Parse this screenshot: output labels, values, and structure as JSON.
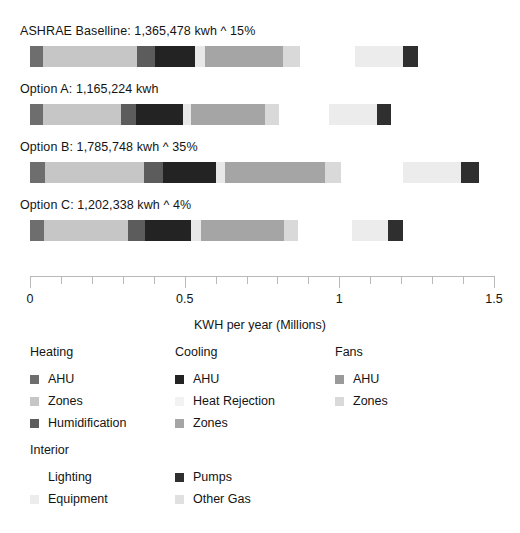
{
  "chart_data": {
    "type": "bar",
    "orientation": "horizontal",
    "stacked": true,
    "title": "",
    "xlabel": "KWH per year (Millions)",
    "ylabel": "",
    "xlim": [
      0,
      1.5
    ],
    "xticks": [
      0,
      0.1,
      0.2,
      0.3,
      0.4,
      0.5,
      0.6,
      0.7,
      0.8,
      0.9,
      1,
      1.1,
      1.2,
      1.3,
      1.4,
      1.5
    ],
    "xtick_labels": [
      "0",
      "0.5",
      "1",
      "1.5"
    ],
    "xtick_label_values": [
      0,
      0.5,
      1,
      1.5
    ],
    "grid": false,
    "legend_position": "below",
    "units": "Millions of KWH per year",
    "categories": [
      "ASHRAE Baselline: 1,365,478 kwh ^ 15%",
      "Option A: 1,165,224 kwh",
      "Option B: 1,785,748 kwh ^ 35%",
      "Option C: 1,202,338 kwh ^ 4%"
    ],
    "series": [
      {
        "name": "Heating AHU",
        "color": "#6e6e6e",
        "values": [
          0.042,
          0.042,
          0.046,
          0.044
        ]
      },
      {
        "name": "Heating Zones",
        "color": "#c6c6c6",
        "values": [
          0.302,
          0.25,
          0.33,
          0.27
        ]
      },
      {
        "name": "Heating Humidification",
        "color": "#5c5c5c",
        "values": [
          0.04,
          0.048,
          0.06,
          0.055
        ]
      },
      {
        "name": "Cooling AHU",
        "color": "#232323",
        "values": [
          0.13,
          0.15,
          0.165,
          0.15
        ]
      },
      {
        "name": "Cooling Heat Rejection",
        "color": "#e8e8e8",
        "values": [
          0.033,
          0.028,
          0.035,
          0.032
        ]
      },
      {
        "name": "Cooling Zones",
        "color": "#a5a5a5",
        "values": [
          0.255,
          0.24,
          0.32,
          0.263
        ]
      },
      {
        "name": "Fans AHU",
        "color": "#9a9a9a",
        "values": [
          0.0,
          0.0,
          0.0,
          0.0
        ]
      },
      {
        "name": "Fans Zones",
        "color": "#d9d9d9",
        "values": [
          0.055,
          0.0,
          0.0,
          0.0
        ]
      },
      {
        "name": "Interior Lighting",
        "color": "#ffffff",
        "values": [
          0.18,
          0.16,
          0.24,
          0.17
        ]
      },
      {
        "name": "Interior Equipment",
        "color": "#ececec",
        "values": [
          0.15,
          0.16,
          0.22,
          0.15
        ]
      },
      {
        "name": "Pumps",
        "color": "#2f2f2f",
        "values": [
          0.048,
          0.048,
          0.06,
          0.048
        ]
      },
      {
        "name": "Other Gas",
        "color": "#e0e0e0",
        "values": [
          0.0,
          0.0,
          0.0,
          0.0
        ]
      }
    ],
    "bars": [
      {
        "label": "ASHRAE Baselline: 1,365,478 kwh ^ 15%",
        "total_kwh": "1,365,478 kwh",
        "delta": "^ 15%",
        "segments": [
          {
            "name": "Heating AHU",
            "color": "#6e6e6e",
            "start": 0.0,
            "end": 0.042
          },
          {
            "name": "Heating Zones",
            "color": "#c6c6c6",
            "start": 0.042,
            "end": 0.345
          },
          {
            "name": "Heating Humidification",
            "color": "#5c5c5c",
            "start": 0.345,
            "end": 0.404
          },
          {
            "name": "Cooling AHU",
            "color": "#232323",
            "start": 0.404,
            "end": 0.533
          },
          {
            "name": "Cooling Heat Rejection",
            "color": "#e8e8e8",
            "start": 0.533,
            "end": 0.566
          },
          {
            "name": "Cooling Zones",
            "color": "#a5a5a5",
            "start": 0.566,
            "end": 0.818
          },
          {
            "name": "Fans Zones",
            "color": "#d9d9d9",
            "start": 0.818,
            "end": 0.873
          },
          {
            "name": "Interior Lighting",
            "color": "#ffffff",
            "start": 0.873,
            "end": 1.05
          },
          {
            "name": "Interior Equipment",
            "color": "#ececec",
            "start": 1.05,
            "end": 1.205
          },
          {
            "name": "Pumps",
            "color": "#2f2f2f",
            "start": 1.205,
            "end": 1.253
          }
        ]
      },
      {
        "label": "Option A: 1,165,224 kwh",
        "total_kwh": "1,165,224 kwh",
        "delta": "",
        "segments": [
          {
            "name": "Heating AHU",
            "color": "#6e6e6e",
            "start": 0.0,
            "end": 0.043
          },
          {
            "name": "Heating Zones",
            "color": "#c6c6c6",
            "start": 0.043,
            "end": 0.295
          },
          {
            "name": "Heating Humidification",
            "color": "#5c5c5c",
            "start": 0.295,
            "end": 0.343
          },
          {
            "name": "Cooling AHU",
            "color": "#232323",
            "start": 0.343,
            "end": 0.495
          },
          {
            "name": "Cooling Heat Rejection",
            "color": "#e8e8e8",
            "start": 0.495,
            "end": 0.522
          },
          {
            "name": "Cooling Zones",
            "color": "#a5a5a5",
            "start": 0.522,
            "end": 0.76
          },
          {
            "name": "Fans Zones",
            "color": "#d9d9d9",
            "start": 0.76,
            "end": 0.805
          },
          {
            "name": "Interior Lighting",
            "color": "#ffffff",
            "start": 0.805,
            "end": 0.968
          },
          {
            "name": "Interior Equipment",
            "color": "#ececec",
            "start": 0.968,
            "end": 1.122
          },
          {
            "name": "Pumps",
            "color": "#2f2f2f",
            "start": 1.122,
            "end": 1.168
          }
        ]
      },
      {
        "label": "Option B: 1,785,748 kwh ^ 35%",
        "total_kwh": "1,785,748 kwh",
        "delta": "^ 35%",
        "segments": [
          {
            "name": "Heating AHU",
            "color": "#6e6e6e",
            "start": 0.0,
            "end": 0.048
          },
          {
            "name": "Heating Zones",
            "color": "#c6c6c6",
            "start": 0.048,
            "end": 0.368
          },
          {
            "name": "Heating Humidification",
            "color": "#5c5c5c",
            "start": 0.368,
            "end": 0.43
          },
          {
            "name": "Cooling AHU",
            "color": "#232323",
            "start": 0.43,
            "end": 0.6
          },
          {
            "name": "Cooling Heat Rejection",
            "color": "#e8e8e8",
            "start": 0.6,
            "end": 0.632
          },
          {
            "name": "Cooling Zones",
            "color": "#a5a5a5",
            "start": 0.632,
            "end": 0.955
          },
          {
            "name": "Fans Zones",
            "color": "#d9d9d9",
            "start": 0.955,
            "end": 1.005
          },
          {
            "name": "Interior Lighting",
            "color": "#ffffff",
            "start": 1.005,
            "end": 1.205
          },
          {
            "name": "Interior Equipment",
            "color": "#ececec",
            "start": 1.205,
            "end": 1.392
          },
          {
            "name": "Pumps",
            "color": "#2f2f2f",
            "start": 1.392,
            "end": 1.45
          }
        ]
      },
      {
        "label": "Option C: 1,202,338 kwh ^ 4%",
        "total_kwh": "1,202,338 kwh",
        "delta": "^ 4%",
        "segments": [
          {
            "name": "Heating AHU",
            "color": "#6e6e6e",
            "start": 0.0,
            "end": 0.046
          },
          {
            "name": "Heating Zones",
            "color": "#c6c6c6",
            "start": 0.046,
            "end": 0.317
          },
          {
            "name": "Heating Humidification",
            "color": "#5c5c5c",
            "start": 0.317,
            "end": 0.372
          },
          {
            "name": "Cooling AHU",
            "color": "#232323",
            "start": 0.372,
            "end": 0.522
          },
          {
            "name": "Cooling Heat Rejection",
            "color": "#e8e8e8",
            "start": 0.522,
            "end": 0.553
          },
          {
            "name": "Cooling Zones",
            "color": "#a5a5a5",
            "start": 0.553,
            "end": 0.82
          },
          {
            "name": "Fans Zones",
            "color": "#d9d9d9",
            "start": 0.82,
            "end": 0.868
          },
          {
            "name": "Interior Lighting",
            "color": "#ffffff",
            "start": 0.868,
            "end": 1.04
          },
          {
            "name": "Interior Equipment",
            "color": "#ececec",
            "start": 1.04,
            "end": 1.158
          },
          {
            "name": "Pumps",
            "color": "#2f2f2f",
            "start": 1.158,
            "end": 1.205
          }
        ]
      }
    ]
  },
  "axis": {
    "title": "KWH per year (Millions)",
    "labels": [
      {
        "value": 0,
        "text": "0"
      },
      {
        "value": 0.5,
        "text": "0.5"
      },
      {
        "value": 1,
        "text": "1"
      },
      {
        "value": 1.5,
        "text": "1.5"
      }
    ]
  },
  "legend": {
    "columns": [
      {
        "blocks": [
          {
            "title": "Heating",
            "items": [
              {
                "label": "AHU",
                "color": "#6e6e6e"
              },
              {
                "label": "Zones",
                "color": "#c6c6c6"
              },
              {
                "label": "Humidification",
                "color": "#5c5c5c"
              }
            ]
          },
          {
            "title": "Interior",
            "items": [
              {
                "label": "Lighting",
                "color": "#ffffff"
              },
              {
                "label": "Equipment",
                "color": "#ececec"
              }
            ]
          }
        ]
      },
      {
        "blocks": [
          {
            "title": "Cooling",
            "items": [
              {
                "label": "AHU",
                "color": "#232323"
              },
              {
                "label": "Heat Rejection",
                "color": "#f2f2f2"
              },
              {
                "label": "Zones",
                "color": "#a5a5a5"
              }
            ]
          },
          {
            "title": "",
            "items": [
              {
                "label": "Pumps",
                "color": "#2f2f2f"
              },
              {
                "label": "Other Gas",
                "color": "#e0e0e0"
              }
            ]
          }
        ]
      },
      {
        "blocks": [
          {
            "title": "Fans",
            "items": [
              {
                "label": "AHU",
                "color": "#9a9a9a"
              },
              {
                "label": "Zones",
                "color": "#d9d9d9"
              }
            ]
          }
        ]
      }
    ]
  }
}
